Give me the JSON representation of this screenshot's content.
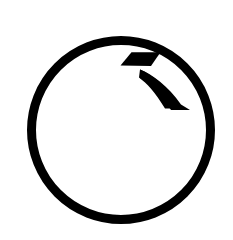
{
  "canvas": {
    "width": 233,
    "height": 240,
    "background_color": "#ffffff"
  },
  "divider": {
    "name": "left vertical rule",
    "color": "#d4d6d8",
    "x": 4,
    "width": 1,
    "height": 240
  },
  "logo": {
    "label": "circular logo mark",
    "ink_color": "#000000",
    "fill_color": "#ffffff",
    "ring": {
      "label": "outer circle outline",
      "center_x": 121,
      "center_y": 130,
      "radius": 94,
      "stroke_width": 9
    },
    "glyph": {
      "label": "stylized seven swoosh mark",
      "top_bar_label": "upper parallelogram bar",
      "wedge_label": "lower curved wedge"
    }
  },
  "alt_text": "Black circular outline logo with a stylized seven shaped mark in the upper right"
}
